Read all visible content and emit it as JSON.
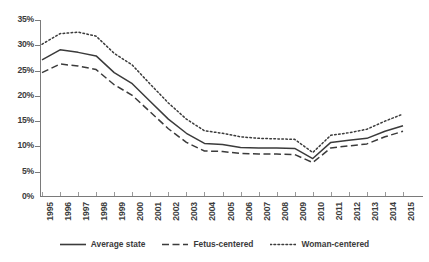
{
  "chart_data": {
    "type": "line",
    "title": "",
    "xlabel": "",
    "ylabel": "",
    "ylim": [
      0,
      35
    ],
    "ytick_labels": [
      "0%",
      "5%",
      "10%",
      "15%",
      "20%",
      "25%",
      "30%",
      "35%"
    ],
    "ytick_values": [
      0,
      5,
      10,
      15,
      20,
      25,
      30,
      35
    ],
    "ytick_format": "percent",
    "grid": false,
    "legend_position": "bottom",
    "categories": [
      "1995",
      "1996",
      "1997",
      "1998",
      "1999",
      "2000",
      "2001",
      "2002",
      "2003",
      "2004",
      "2005",
      "2006",
      "2007",
      "2008",
      "2009",
      "2010",
      "2011",
      "2012",
      "2013",
      "2014",
      "2015"
    ],
    "series": [
      {
        "name": "Average state",
        "style": "solid",
        "color": "#3b3b3b",
        "values": [
          27.1,
          29.1,
          28.6,
          27.9,
          24.6,
          22.4,
          18.9,
          15.4,
          12.6,
          10.6,
          10.4,
          9.8,
          9.7,
          9.7,
          9.6,
          7.6,
          10.8,
          11.2,
          11.6,
          13.0,
          14.1
        ]
      },
      {
        "name": "Fetus-centered",
        "style": "dashed",
        "color": "#3b3b3b",
        "values": [
          24.6,
          26.3,
          25.9,
          25.2,
          22.2,
          20.1,
          16.8,
          13.5,
          10.8,
          9.1,
          9.0,
          8.6,
          8.5,
          8.5,
          8.4,
          6.8,
          9.7,
          10.1,
          10.5,
          11.9,
          13.0
        ]
      },
      {
        "name": "Woman-centered",
        "style": "dotted",
        "color": "#3b3b3b",
        "values": [
          30.2,
          32.3,
          32.6,
          31.8,
          28.4,
          26.1,
          22.3,
          18.6,
          15.4,
          13.1,
          12.6,
          11.9,
          11.6,
          11.5,
          11.4,
          8.8,
          12.2,
          12.7,
          13.4,
          15.0,
          16.4
        ]
      }
    ]
  },
  "legend": {
    "items": [
      {
        "label": "Average state",
        "style": "solid"
      },
      {
        "label": "Fetus-centered",
        "style": "dashed"
      },
      {
        "label": "Woman-centered",
        "style": "dotted"
      }
    ]
  }
}
